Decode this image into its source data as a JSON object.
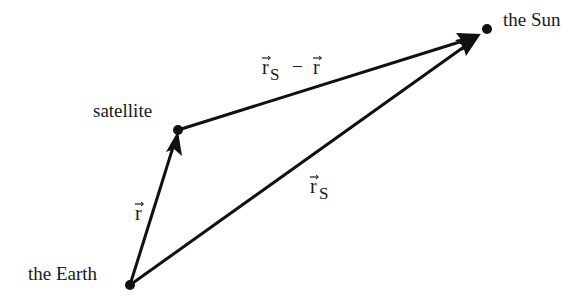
{
  "diagram": {
    "colors": {
      "ink": "#111111",
      "text": "#1a1a1a",
      "background": "#ffffff"
    },
    "nodes": {
      "earth": {
        "label": "the Earth",
        "x": 130,
        "y": 285
      },
      "satellite": {
        "label": "satellite",
        "x": 178,
        "y": 130
      },
      "sun": {
        "label": "the Sun",
        "x": 487,
        "y": 29
      }
    },
    "vectors": {
      "r": {
        "symbol": "r",
        "from": "earth",
        "to": "satellite",
        "label": "r⃗"
      },
      "rs": {
        "symbol": "r",
        "subscript": "S",
        "from": "earth",
        "to": "sun",
        "label": "r⃗S"
      },
      "rs_minus_r": {
        "symbol": "r",
        "subscript": "S",
        "operator": "−",
        "symbol2": "r",
        "from": "satellite",
        "to": "sun",
        "label": "r⃗S − r⃗"
      }
    }
  }
}
